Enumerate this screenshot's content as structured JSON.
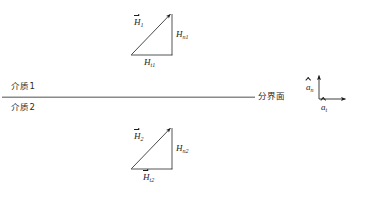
{
  "figure": {
    "colors": {
      "line": "#1c1c1c",
      "interface_line": "#8a8a8a",
      "text": "#1a1a1a"
    }
  },
  "media": {
    "upper_label": "介质1",
    "lower_label": "介质2"
  },
  "interface": {
    "label": "分界面",
    "leader_dash": "—"
  },
  "upper_triangle": {
    "resultant": {
      "symbol": "H",
      "subscript": "1",
      "vector": true
    },
    "normal": {
      "symbol": "H",
      "subscript": "n1",
      "vector": false
    },
    "tangential": {
      "symbol": "H",
      "subscript": "t1",
      "vector": false
    }
  },
  "lower_triangle": {
    "resultant": {
      "symbol": "H",
      "subscript": "2",
      "vector": true
    },
    "normal": {
      "symbol": "H",
      "subscript": "n2",
      "vector": false
    },
    "tangential": {
      "symbol": "H",
      "subscript": "t2",
      "vector": true
    }
  },
  "axes": {
    "normal_unit": {
      "symbol": "a",
      "subscript": "n"
    },
    "tangential_unit": {
      "symbol": "a",
      "subscript": "t"
    }
  },
  "diagram_data": {
    "type": "vector-diagram",
    "description": "Two right triangles showing H field decomposed into normal and tangential components on either side of a planar interface.",
    "interface_line": {
      "x1": 2,
      "y1": 97,
      "x2": 255,
      "y2": 97
    },
    "upper_triangle_vertices": {
      "apex": [
        172,
        12
      ],
      "bottom_left": [
        131,
        55
      ],
      "bottom_right": [
        172,
        55
      ]
    },
    "lower_triangle_vertices": {
      "apex": [
        172,
        126
      ],
      "bottom_left": [
        131,
        169
      ],
      "bottom_right": [
        172,
        169
      ]
    },
    "axes_origin": [
      319,
      99
    ],
    "axes_normal_tip": [
      319,
      74
    ],
    "axes_tangential_tip": [
      347,
      99
    ]
  }
}
